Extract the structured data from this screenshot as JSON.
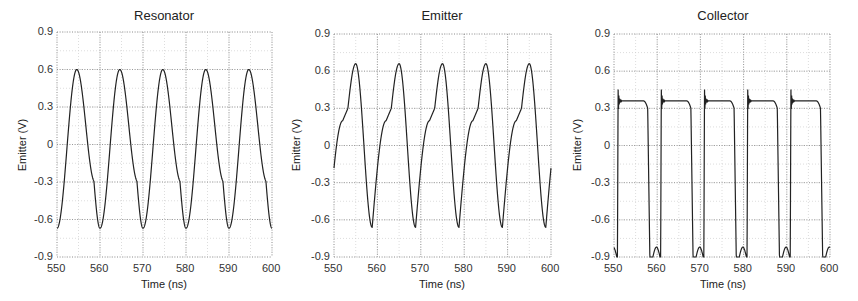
{
  "chart_data": [
    {
      "type": "line",
      "title": "Resonator",
      "xlabel": "Time (ns)",
      "ylabel": "Emitter (V)",
      "xlim": [
        550,
        600
      ],
      "ylim": [
        -0.9,
        0.9
      ],
      "xticks": [
        "550",
        "560",
        "570",
        "580",
        "590",
        "600"
      ],
      "yticks": [
        "0.9",
        "0.6",
        "0.3",
        "0",
        "-0.3",
        "-0.6",
        "-0.9"
      ],
      "grid": true,
      "series": [
        {
          "name": "Resonator",
          "period_ns": 10,
          "max": 0.6,
          "min": -0.67,
          "description": "Periodic quasi-sinusoid, peaks at ~554.5+10k ns, troughs at ~560+10k ns with a kink near -0.3 V"
        }
      ]
    },
    {
      "type": "line",
      "title": "Emitter",
      "xlabel": "Time (ns)",
      "ylabel": "Emitter (V)",
      "xlim": [
        550,
        600
      ],
      "ylim": [
        -0.9,
        0.9
      ],
      "xticks": [
        "550",
        "560",
        "570",
        "580",
        "590",
        "600"
      ],
      "yticks": [
        "0.9",
        "0.6",
        "0.3",
        "0",
        "-0.3",
        "-0.6",
        "-0.9"
      ],
      "grid": true,
      "series": [
        {
          "name": "Emitter",
          "period_ns": 10,
          "max": 0.66,
          "min": -0.66,
          "description": "Periodic waveform, peaks ~555+10k ns, troughs ~559+10k ns, shoulder near 0.3 V on rising edge"
        }
      ]
    },
    {
      "type": "line",
      "title": "Collector",
      "xlabel": "Time (ns)",
      "ylabel": "Emitter (V)",
      "xlim": [
        550,
        600
      ],
      "ylim": [
        -0.9,
        0.9
      ],
      "xticks": [
        "550",
        "560",
        "570",
        "580",
        "590",
        "600"
      ],
      "yticks": [
        "0.9",
        "0.6",
        "0.3",
        "0",
        "-0.3",
        "-0.6",
        "-0.9"
      ],
      "grid": true,
      "series": [
        {
          "name": "Collector",
          "period_ns": 10,
          "max": 0.48,
          "plateau": 0.36,
          "min": -0.9,
          "description": "Pulse-like waveform: rises at ~551+10k ns with ringing spike to ~0.47 V, plateau ~0.36 V, falls to -0.9 V at ~558+10k ns"
        }
      ]
    }
  ],
  "panels": [
    {
      "title": "Resonator",
      "xlabel": "Time (ns)",
      "ylabel": "Emitter (V)"
    },
    {
      "title": "Emitter",
      "xlabel": "Time (ns)",
      "ylabel": "Emitter (V)"
    },
    {
      "title": "Collector",
      "xlabel": "Time (ns)",
      "ylabel": "Emitter (V)"
    }
  ],
  "ticks": {
    "x": [
      "550",
      "560",
      "570",
      "580",
      "590",
      "600"
    ],
    "y": [
      "0.9",
      "0.6",
      "0.3",
      "0",
      "-0.3",
      "-0.6",
      "-0.9"
    ]
  }
}
